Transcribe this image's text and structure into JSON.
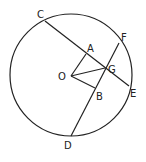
{
  "diagram": {
    "type": "circle-geometry",
    "circle": {
      "center_label": "O",
      "cx": 71,
      "cy": 75,
      "r": 61
    },
    "points": {
      "O": {
        "x": 71,
        "y": 76,
        "label": "O"
      },
      "C": {
        "x": 45,
        "y": 21,
        "label": "C"
      },
      "E": {
        "x": 129,
        "y": 86,
        "label": "E"
      },
      "F": {
        "x": 119,
        "y": 43,
        "label": "F"
      },
      "D": {
        "x": 71,
        "y": 136,
        "label": "D"
      },
      "A": {
        "x": 86,
        "y": 54,
        "label": "A"
      },
      "B": {
        "x": 95,
        "y": 88,
        "label": "B"
      },
      "G": {
        "x": 105,
        "y": 68,
        "label": "G"
      }
    },
    "segments": [
      {
        "from": "C",
        "to": "E",
        "name": "chord-CE"
      },
      {
        "from": "F",
        "to": "D",
        "name": "chord-FD"
      },
      {
        "from": "O",
        "to": "A",
        "name": "segment-OA"
      },
      {
        "from": "O",
        "to": "B",
        "name": "segment-OB"
      },
      {
        "from": "O",
        "to": "G",
        "name": "segment-OG"
      }
    ],
    "stroke_color": "#222222"
  }
}
